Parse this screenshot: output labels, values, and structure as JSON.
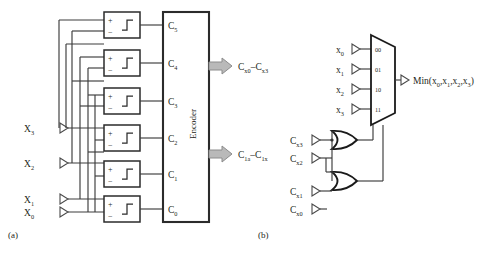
{
  "figure": {
    "panels": [
      {
        "id": "a",
        "caption": "(a)",
        "inputs": [
          {
            "name": "X",
            "sub": "3"
          },
          {
            "name": "X",
            "sub": "2"
          },
          {
            "name": "X",
            "sub": "1"
          },
          {
            "name": "X",
            "sub": "0"
          }
        ],
        "comparators": [
          {
            "plus": "+",
            "minus": "−"
          },
          {
            "plus": "+",
            "minus": "−"
          },
          {
            "plus": "+",
            "minus": "−"
          },
          {
            "plus": "+",
            "minus": "−"
          },
          {
            "plus": "+",
            "minus": "−"
          },
          {
            "plus": "+",
            "minus": "−"
          }
        ],
        "comparator_outputs": [
          {
            "name": "C",
            "sub": "5"
          },
          {
            "name": "C",
            "sub": "4"
          },
          {
            "name": "C",
            "sub": "3"
          },
          {
            "name": "C",
            "sub": "2"
          },
          {
            "name": "C",
            "sub": "1"
          },
          {
            "name": "C",
            "sub": "0"
          }
        ],
        "block_label": "Encoder",
        "outputs": [
          {
            "from": {
              "name": "C",
              "sub": "x0"
            },
            "dash": "–",
            "to": {
              "name": "C",
              "sub": "x3"
            }
          },
          {
            "from": {
              "name": "C",
              "sub": "1a"
            },
            "dash": "–",
            "to": {
              "name": "C",
              "sub": "1x"
            }
          }
        ]
      },
      {
        "id": "b",
        "caption": "(b)",
        "mux_inputs": [
          {
            "name": "x",
            "sub": "0"
          },
          {
            "name": "x",
            "sub": "1"
          },
          {
            "name": "x",
            "sub": "2"
          },
          {
            "name": "x",
            "sub": "3"
          }
        ],
        "mux_select_labels": [
          "00",
          "01",
          "10",
          "11"
        ],
        "output_label": {
          "prefix": "Min(x",
          "s0": "0",
          "c1": ",x",
          "s1": "1",
          "c2": ",x",
          "s2": "2",
          "c3": ",x",
          "s3": "3",
          "suffix": ")"
        },
        "control_inputs": [
          {
            "name": "C",
            "sub": "x3"
          },
          {
            "name": "C",
            "sub": "x2"
          },
          {
            "name": "C",
            "sub": "x1"
          },
          {
            "name": "C",
            "sub": "x0"
          }
        ],
        "gates": [
          {
            "type": "or-gate"
          },
          {
            "type": "or-gate"
          }
        ]
      }
    ]
  },
  "colors": {
    "line": "#3c3c3c",
    "heavy": "#1a1a1a",
    "arrow_fill": "#b9b9b9",
    "text": "#231f20"
  }
}
